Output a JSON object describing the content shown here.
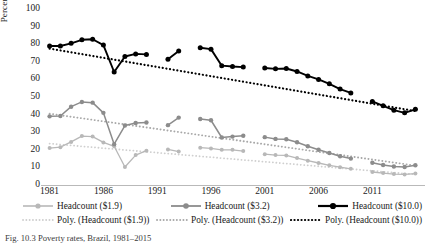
{
  "figure": {
    "caption": "Fig. 10.3  Poverty rates, Brazil, 1981–2015"
  },
  "chart_data": {
    "type": "line",
    "title": "",
    "xlabel": "",
    "ylabel": "Percentage",
    "xlim": [
      1980.2,
      2015.8
    ],
    "ylim": [
      0,
      100
    ],
    "ytick_values": [
      0,
      10,
      20,
      30,
      40,
      50,
      60,
      70,
      80,
      90,
      100
    ],
    "ytick_labels": [
      "0",
      "10",
      "20",
      "30",
      "40",
      "50",
      "60",
      "70",
      "80",
      "90",
      "100"
    ],
    "xtick_values": [
      1981,
      1986,
      1991,
      1996,
      2001,
      2006,
      2011
    ],
    "xtick_labels": [
      "1981",
      "1986",
      "1991",
      "1996",
      "2001",
      "2006",
      "2011"
    ],
    "grid": false,
    "legend_position": "bottom",
    "colors": {
      "headcount_1_9": "#b8b8b8",
      "headcount_3_2": "#8c8c8c",
      "headcount_10_0": "#000000",
      "axis": "#b9b9b9",
      "text": "#1a1a1a"
    },
    "series": [
      {
        "name": "Headcount ($1.9)",
        "color": "#b8b8b8",
        "marker": "circle",
        "x": [
          1981,
          1982,
          1983,
          1984,
          1985,
          1986,
          1987,
          1988,
          1989,
          1990,
          1992,
          1993,
          1995,
          1996,
          1997,
          1998,
          1999,
          2001,
          2002,
          2003,
          2004,
          2005,
          2006,
          2007,
          2008,
          2009,
          2011,
          2012,
          2013,
          2014,
          2015
        ],
        "values": [
          21.0,
          21.5,
          24.5,
          27.8,
          27.5,
          24.2,
          22.0,
          10.2,
          17.0,
          19.5,
          20.2,
          19.0,
          21.2,
          20.8,
          20.0,
          20.0,
          19.3,
          17.5,
          17.0,
          16.8,
          15.3,
          13.8,
          12.5,
          11.2,
          10.1,
          9.2,
          7.4,
          6.8,
          6.2,
          6.0,
          6.5
        ]
      },
      {
        "name": "Headcount ($3.2)",
        "color": "#8c8c8c",
        "marker": "circle",
        "x": [
          1981,
          1982,
          1983,
          1984,
          1985,
          1986,
          1987,
          1988,
          1989,
          1990,
          1992,
          1993,
          1995,
          1996,
          1997,
          1998,
          1999,
          2001,
          2002,
          2003,
          2004,
          2005,
          2006,
          2007,
          2008,
          2009,
          2011,
          2012,
          2013,
          2014,
          2015
        ],
        "values": [
          39.0,
          39.2,
          44.5,
          47.2,
          46.8,
          41.0,
          23.2,
          33.8,
          35.2,
          35.5,
          34.0,
          38.3,
          37.5,
          36.8,
          27.0,
          27.5,
          28.0,
          27.2,
          26.2,
          26.0,
          24.3,
          22.0,
          20.0,
          18.2,
          16.3,
          15.0,
          12.6,
          11.4,
          10.5,
          10.2,
          11.2
        ]
      },
      {
        "name": "Headcount ($10.0)",
        "color": "#000000",
        "marker": "circle",
        "x": [
          1981,
          1982,
          1983,
          1984,
          1985,
          1986,
          1987,
          1988,
          1989,
          1990,
          1992,
          1993,
          1995,
          1996,
          1997,
          1998,
          1999,
          2001,
          2002,
          2003,
          2004,
          2005,
          2006,
          2007,
          2008,
          2009,
          2011,
          2012,
          2013,
          2014,
          2015
        ],
        "values": [
          79.0,
          79.0,
          80.5,
          82.5,
          82.8,
          79.5,
          64.2,
          73.0,
          74.5,
          74.2,
          71.5,
          76.2,
          78.0,
          77.2,
          67.8,
          67.3,
          67.0,
          66.5,
          66.0,
          66.2,
          64.5,
          62.0,
          60.0,
          57.5,
          54.5,
          52.3,
          47.5,
          45.0,
          42.5,
          41.0,
          43.0
        ]
      }
    ],
    "trendlines": [
      {
        "name": "Poly. (Headcount ($1.9))",
        "color": "#cfcfcf",
        "style": "dotted",
        "x": [
          1981,
          2015
        ],
        "values": [
          23.5,
          6.0
        ]
      },
      {
        "name": "Poly. (Headcount ($3.2))",
        "color": "#a8a8a8",
        "style": "dotted",
        "x": [
          1981,
          2015
        ],
        "values": [
          40.5,
          11.0
        ]
      },
      {
        "name": "Poly. (Headcount ($10.0))",
        "color": "#000000",
        "style": "dotted",
        "x": [
          1981,
          2015
        ],
        "values": [
          77.5,
          42.0
        ]
      }
    ],
    "legend": [
      {
        "label": "Headcount ($1.9)",
        "color": "#b8b8b8",
        "kind": "line-marker"
      },
      {
        "label": "Headcount ($3.2)",
        "color": "#8c8c8c",
        "kind": "line-marker"
      },
      {
        "label": "Headcount ($10.0)",
        "color": "#000000",
        "kind": "line-marker"
      },
      {
        "label": "Poly. (Headcount ($1.9))",
        "color": "#cfcfcf",
        "kind": "dotted"
      },
      {
        "label": "Poly. (Headcount ($3.2))",
        "color": "#a8a8a8",
        "kind": "dotted"
      },
      {
        "label": "Poly. (Headcount ($10.0))",
        "color": "#000000",
        "kind": "dotted"
      }
    ]
  }
}
